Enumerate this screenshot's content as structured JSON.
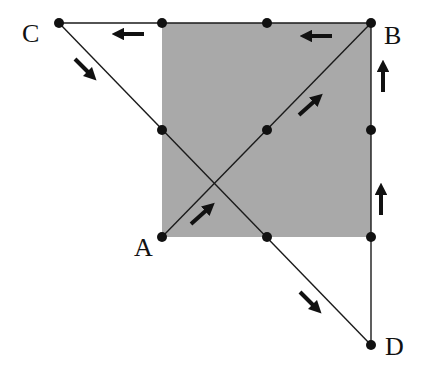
{
  "diagram": {
    "type": "directed-path-on-square",
    "colors": {
      "square_fill": "#a9a9a9",
      "line": "#1a1a1a",
      "dot": "#111111",
      "arrow": "#111111",
      "background": "#ffffff"
    },
    "labels": {
      "A": "A",
      "B": "B",
      "C": "C",
      "D": "D"
    },
    "square": {
      "x": 162,
      "y": 23,
      "width": 209,
      "height": 214
    },
    "points": [
      {
        "id": "C",
        "x": 59,
        "y": 23
      },
      {
        "id": "top-left",
        "x": 162,
        "y": 23
      },
      {
        "id": "top-mid",
        "x": 267,
        "y": 23
      },
      {
        "id": "B",
        "x": 371,
        "y": 23
      },
      {
        "id": "mid-left",
        "x": 162,
        "y": 130
      },
      {
        "id": "center",
        "x": 267,
        "y": 130
      },
      {
        "id": "mid-right",
        "x": 371,
        "y": 130
      },
      {
        "id": "A",
        "x": 162,
        "y": 237
      },
      {
        "id": "bottom-mid",
        "x": 267,
        "y": 237
      },
      {
        "id": "bottom-right",
        "x": 371,
        "y": 237
      },
      {
        "id": "D",
        "x": 371,
        "y": 345
      }
    ],
    "path_description": "A → B (diagonal up), B → C (leftward along top), C → D (diagonal down), D → B (upward along right side)",
    "arrows": [
      {
        "segment": "A-B",
        "direction": "up-right"
      },
      {
        "segment": "A-B",
        "direction": "up-right"
      },
      {
        "segment": "B-C",
        "direction": "left"
      },
      {
        "segment": "B-C",
        "direction": "left"
      },
      {
        "segment": "C-D",
        "direction": "down-right"
      },
      {
        "segment": "C-D",
        "direction": "down-right"
      },
      {
        "segment": "D-B",
        "direction": "up"
      },
      {
        "segment": "D-B",
        "direction": "up"
      }
    ]
  }
}
